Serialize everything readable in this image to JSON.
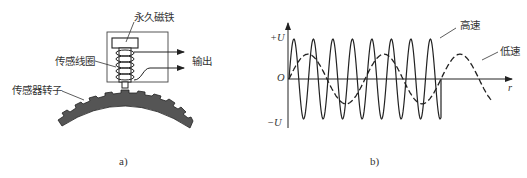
{
  "panel_a": {
    "caption": "a)",
    "labels": {
      "magnet": "永久磁铁",
      "coil": "传感线圈",
      "rotor": "传感器转子",
      "output": "输出"
    }
  },
  "panel_b": {
    "caption": "b)",
    "labels": {
      "high_speed": "高速",
      "low_speed": "低速",
      "y_pos": "+U",
      "y_neg": "−U",
      "origin": "O",
      "x_axis": "r"
    }
  },
  "chart_data": {
    "type": "line",
    "title": "",
    "xlabel": "r",
    "ylabel": "",
    "y_ticks": [
      "+U",
      "O",
      "−U"
    ],
    "grid": false,
    "series": [
      {
        "name": "高速",
        "style": "solid",
        "amplitude": 1.0,
        "cycles": 8,
        "description": "high-frequency sine, peaks reach ±U"
      },
      {
        "name": "低速",
        "style": "dashed",
        "amplitude": 0.62,
        "cycles": 2.6,
        "description": "low-frequency sine, smaller amplitude"
      }
    ]
  },
  "colors": {
    "line": "#222222",
    "rotor_fill": "#555555",
    "background": "#ffffff"
  }
}
